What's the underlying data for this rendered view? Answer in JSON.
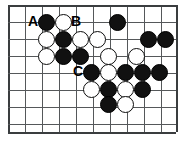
{
  "figure": {
    "kind": "go-board-diagram",
    "width": 184,
    "height": 145,
    "background_color": "#ffffff",
    "line_color": "#55585a",
    "edge_color": "#3a3d3f",
    "black_stone_color": "#111111",
    "white_stone_color": "#ffffff",
    "stone_diameter": 17,
    "grid": {
      "columns": 10,
      "rows": 7,
      "spacing": 17,
      "origin_x": 8,
      "origin_y": 5,
      "column_x": [
        8,
        25,
        42,
        59,
        76,
        93,
        110,
        127,
        144,
        161,
        176
      ],
      "row_y": [
        5,
        22,
        39,
        56,
        73,
        90,
        107,
        124,
        132
      ]
    },
    "stones": [
      {
        "color": "black",
        "cx": 46,
        "cy": 22
      },
      {
        "color": "white",
        "cx": 63,
        "cy": 22
      },
      {
        "color": "black",
        "cx": 117,
        "cy": 22
      },
      {
        "color": "white",
        "cx": 46,
        "cy": 39
      },
      {
        "color": "black",
        "cx": 63,
        "cy": 39
      },
      {
        "color": "white",
        "cx": 80,
        "cy": 39
      },
      {
        "color": "white",
        "cx": 97,
        "cy": 39
      },
      {
        "color": "black",
        "cx": 148,
        "cy": 39
      },
      {
        "color": "black",
        "cx": 165,
        "cy": 39
      },
      {
        "color": "white",
        "cx": 46,
        "cy": 56
      },
      {
        "color": "black",
        "cx": 63,
        "cy": 56
      },
      {
        "color": "black",
        "cx": 80,
        "cy": 56
      },
      {
        "color": "white",
        "cx": 108,
        "cy": 56
      },
      {
        "color": "white",
        "cx": 136,
        "cy": 56
      },
      {
        "color": "black",
        "cx": 91,
        "cy": 72
      },
      {
        "color": "white",
        "cx": 108,
        "cy": 72
      },
      {
        "color": "black",
        "cx": 125,
        "cy": 72
      },
      {
        "color": "black",
        "cx": 142,
        "cy": 72
      },
      {
        "color": "black",
        "cx": 159,
        "cy": 72
      },
      {
        "color": "white",
        "cx": 91,
        "cy": 89
      },
      {
        "color": "black",
        "cx": 108,
        "cy": 89
      },
      {
        "color": "white",
        "cx": 125,
        "cy": 89
      },
      {
        "color": "black",
        "cx": 142,
        "cy": 89
      },
      {
        "color": "black",
        "cx": 108,
        "cy": 104
      },
      {
        "color": "white",
        "cx": 125,
        "cy": 104
      }
    ],
    "labels": [
      {
        "text": "A",
        "x": 33,
        "y": 22,
        "font_size": 14
      },
      {
        "text": "B",
        "x": 76,
        "y": 22,
        "font_size": 14
      },
      {
        "text": "C",
        "x": 78,
        "y": 72,
        "font_size": 14
      }
    ]
  }
}
